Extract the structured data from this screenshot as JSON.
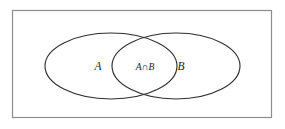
{
  "figure": {
    "kind": "venn-diagram",
    "background_color": "#ffffff"
  },
  "universe": {
    "name": "universal-set-rectangle",
    "label": "",
    "border_color": "#8d8d8d",
    "fill_color": "#ffffff",
    "x": 12,
    "y": 10,
    "width": 260,
    "height": 108
  },
  "sets": [
    {
      "id": "set-a",
      "label": "A",
      "cx": 111,
      "cy": 66,
      "rx": 66,
      "ry": 33,
      "stroke_color": "#2f2f33",
      "label_x": 98,
      "label_y": 70
    },
    {
      "id": "set-b",
      "label": "B",
      "cx": 176,
      "cy": 66,
      "rx": 64,
      "ry": 33,
      "stroke_color": "#2f2f33",
      "label_x": 181,
      "label_y": 70
    }
  ],
  "intersection": {
    "id": "set-a-intersect-b",
    "label_left": "A",
    "label_operator": "∩",
    "label_right": "B",
    "label_full": "A ∩ B",
    "label_x": 145,
    "label_y": 70
  }
}
